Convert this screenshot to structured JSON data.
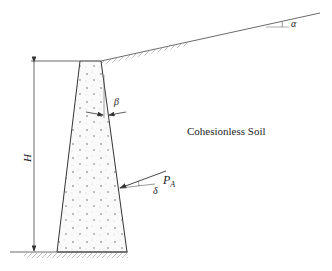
{
  "diagram": {
    "labels": {
      "soil": "Cohesionless Soil",
      "height": "H",
      "backfill_angle": "α",
      "wall_batter_angle": "β",
      "active_force_main": "P",
      "active_force_sub": "A",
      "wall_friction_angle": "δ"
    },
    "colors": {
      "line": "#333333",
      "hatch": "#888888",
      "fill_dots": "#666666",
      "text": "#222222"
    }
  }
}
